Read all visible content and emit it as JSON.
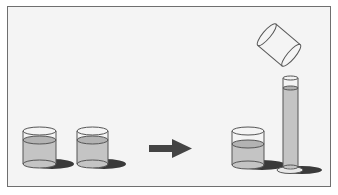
{
  "figure": {
    "colors": {
      "frame_border": "#6f6f6f",
      "frame_fill": "#f4f4f4",
      "glass_outline": "#555555",
      "liquid": "#c4c4c4",
      "liquid_surface": "#a9a9a9",
      "shadow": "#3a3a3a",
      "arrow": "#444444"
    },
    "items": [
      {
        "id": "beaker-1",
        "kind": "beaker",
        "state": "partially filled"
      },
      {
        "id": "beaker-2",
        "kind": "beaker",
        "state": "partially filled"
      },
      {
        "id": "arrow",
        "kind": "arrow",
        "direction": "right"
      },
      {
        "id": "beaker-3",
        "kind": "beaker",
        "state": "partially filled"
      },
      {
        "id": "tilted-beaker",
        "kind": "beaker",
        "state": "empty, tilted pouring"
      },
      {
        "id": "graduated-cylinder",
        "kind": "graduated cylinder",
        "state": "filled"
      }
    ]
  }
}
